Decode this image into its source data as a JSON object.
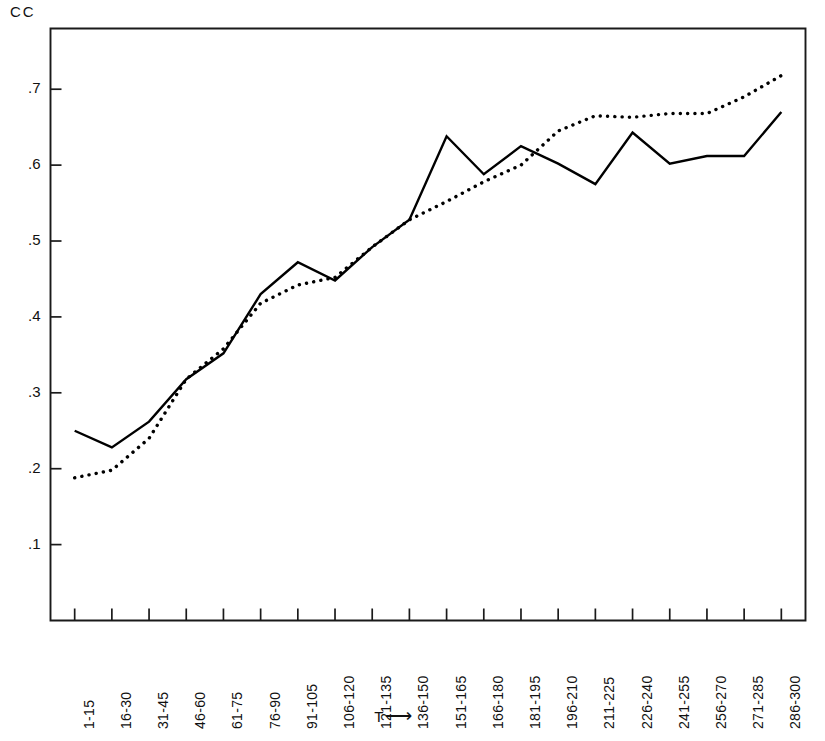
{
  "chart_data": {
    "type": "line",
    "title": "",
    "ylabel": "CC",
    "xlabel": "T",
    "xlabel_arrow": "⟶",
    "categories": [
      "1-15",
      "16-30",
      "31-45",
      "46-60",
      "61-75",
      "76-90",
      "91-105",
      "106-120",
      "121-135",
      "136-150",
      "151-165",
      "166-180",
      "181-195",
      "196-210",
      "211-225",
      "226-240",
      "241-255",
      "256-270",
      "271-285",
      "286-300"
    ],
    "ylim": [
      0.0,
      0.78
    ],
    "yticks": [
      0.1,
      0.2,
      0.3,
      0.4,
      0.5,
      0.6,
      0.7
    ],
    "ytick_labels": [
      ".1",
      ".2",
      ".3",
      ".4",
      ".5",
      ".6",
      ".7"
    ],
    "grid": false,
    "legend": "none",
    "series": [
      {
        "name": "solid",
        "style": "solid",
        "color": "#000000",
        "values": [
          0.25,
          0.228,
          0.262,
          0.318,
          0.352,
          0.43,
          0.472,
          0.448,
          0.492,
          0.528,
          0.638,
          0.588,
          0.625,
          0.602,
          0.575,
          0.643,
          0.602,
          0.612,
          0.612,
          0.67
        ]
      },
      {
        "name": "dotted",
        "style": "dotted",
        "color": "#000000",
        "values": [
          0.188,
          0.198,
          0.24,
          0.318,
          0.358,
          0.418,
          0.442,
          0.452,
          0.492,
          0.528,
          0.552,
          0.578,
          0.6,
          0.645,
          0.665,
          0.663,
          0.668,
          0.668,
          0.69,
          0.718
        ]
      }
    ]
  },
  "axes": {
    "ytick_count": 7,
    "xtick_count": 20
  }
}
